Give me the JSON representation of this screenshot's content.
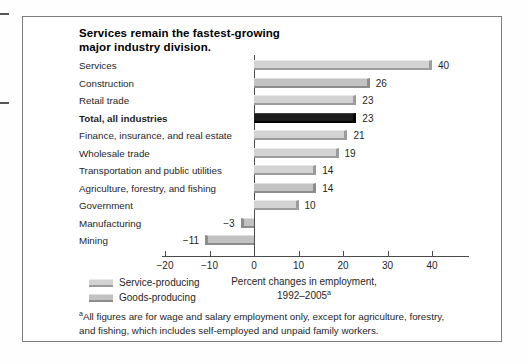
{
  "figure": {
    "kind": "scanned-report-bar-chart"
  },
  "chart_data": {
    "type": "bar",
    "orientation": "horizontal",
    "title": "Services remain the fastest-growing major industry division.",
    "title_lines": [
      "Services remain the fastest-growing",
      "major industry division."
    ],
    "xlabel_line1": "Percent changes in employment,",
    "xlabel_line2": "1992–2005",
    "xlabel_sup": "a",
    "xlim": [
      -20,
      40
    ],
    "grid": false,
    "rows": [
      {
        "category": "Services",
        "value": 40,
        "value_label": "40",
        "group": "service",
        "bold": false
      },
      {
        "category": "Construction",
        "value": 26,
        "value_label": "26",
        "group": "goods",
        "bold": false
      },
      {
        "category": "Retail trade",
        "value": 23,
        "value_label": "23",
        "group": "service",
        "bold": false
      },
      {
        "category": "Total, all industries",
        "value": 23,
        "value_label": "23",
        "group": "total",
        "bold": true
      },
      {
        "category": "Finance, insurance, and real estate",
        "value": 21,
        "value_label": "21",
        "group": "service",
        "bold": false
      },
      {
        "category": "Wholesale trade",
        "value": 19,
        "value_label": "19",
        "group": "service",
        "bold": false
      },
      {
        "category": "Transportation and public utilities",
        "value": 14,
        "value_label": "14",
        "group": "service",
        "bold": false
      },
      {
        "category": "Agriculture, forestry, and fishing",
        "value": 14,
        "value_label": "14",
        "group": "goods",
        "bold": false
      },
      {
        "category": "Government",
        "value": 10,
        "value_label": "10",
        "group": "service",
        "bold": false
      },
      {
        "category": "Manufacturing",
        "value": -3,
        "value_label": "−3",
        "group": "goods",
        "bold": false
      },
      {
        "category": "Mining",
        "value": -11,
        "value_label": "−11",
        "group": "goods",
        "bold": false
      }
    ],
    "ticks": [
      {
        "value": -20,
        "label": "−20"
      },
      {
        "value": -10,
        "label": "−10"
      },
      {
        "value": 0,
        "label": "0"
      },
      {
        "value": 10,
        "label": "10"
      },
      {
        "value": 20,
        "label": "20"
      },
      {
        "value": 30,
        "label": "30"
      },
      {
        "value": 40,
        "label": "40"
      }
    ]
  },
  "legend": {
    "position": "bottom-left",
    "items": [
      {
        "label": "Service-producing",
        "group": "service"
      },
      {
        "label": "Goods-producing",
        "group": "goods"
      }
    ]
  },
  "footnote": {
    "sup": "a",
    "line1": "All figures are for wage and salary employment only, except for agriculture, forestry,",
    "line2": "and fishing, which includes self-employed and unpaid family workers."
  },
  "colors": {
    "service_fill": "#d3d3d3",
    "service_highlight": "#e9e9e9",
    "service_shadow": "#9c9c9c",
    "goods_fill": "#c2c2c2",
    "goods_highlight": "#dedede",
    "goods_shadow": "#8c8c8c",
    "total_fill": "#1b1b1b",
    "total_highlight": "#3d3d3d",
    "total_shadow": "#000000",
    "axis": "#4a4a4a",
    "box_border": "#7d7d7d",
    "text": "#1f1f1f"
  }
}
